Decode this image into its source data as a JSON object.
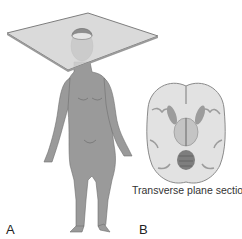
{
  "figure": {
    "panels": [
      {
        "label": "A",
        "content": "Standing female human figure with a transverse plane through the head"
      },
      {
        "label": "B",
        "content": "Transverse section of brain",
        "caption": "Transverse plane section"
      }
    ]
  },
  "colors": {
    "plane_fill": "#d4d4d4",
    "plane_edge": "#8a8a8a",
    "body": "#9a9a9a",
    "brain_light": "#e2e2e2",
    "brain_dark": "#9c9c9c"
  }
}
